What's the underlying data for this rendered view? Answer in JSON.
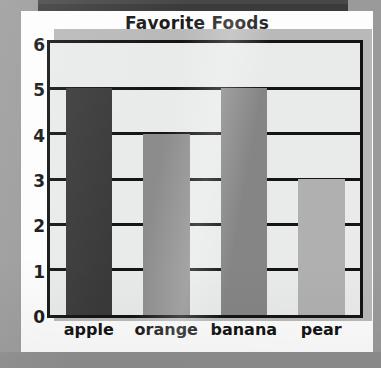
{
  "chart_data": {
    "type": "bar",
    "title": "Favorite Foods",
    "xlabel": "",
    "ylabel": "",
    "categories": [
      "apple",
      "orange",
      "banana",
      "pear"
    ],
    "values": [
      5,
      4,
      5,
      3
    ],
    "ylim": [
      0,
      6
    ],
    "yticks": [
      "0",
      "1",
      "2",
      "3",
      "4",
      "5",
      "6"
    ],
    "grid": true,
    "legend": "none",
    "bar_colors": [
      "#3a3a3a",
      "#8c8c8c",
      "#858585",
      "#b0b0b0"
    ],
    "plot_background": "#e9eaea",
    "axis_color": "#141414"
  },
  "page": {
    "background_color": "#9a9a9a",
    "card_color": "#fdfdfd",
    "top_band_color": "#3b3b3b"
  }
}
